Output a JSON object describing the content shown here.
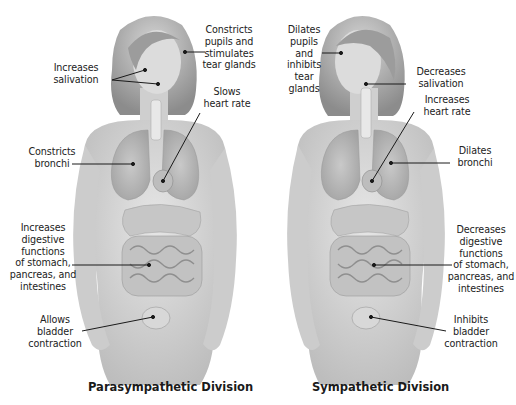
{
  "diagram": {
    "divisions": [
      {
        "name": "Parasympathetic Division",
        "labels": [
          {
            "id": "eyes",
            "text": "Constricts\npupils and\nstimulates\ntear glands"
          },
          {
            "id": "salivation",
            "text": "Increases\nsalivation"
          },
          {
            "id": "heart",
            "text": "Slows\nheart rate"
          },
          {
            "id": "bronchi",
            "text": "Constricts\nbronchi"
          },
          {
            "id": "digestion",
            "text": "Increases\ndigestive\nfunctions\nof stomach,\npancreas, and\nintestines"
          },
          {
            "id": "bladder",
            "text": "Allows\nbladder\ncontraction"
          }
        ]
      },
      {
        "name": "Sympathetic Division",
        "labels": [
          {
            "id": "eyes",
            "text": "Dilates\npupils\nand\ninhibits\ntear\nglands"
          },
          {
            "id": "salivation",
            "text": "Decreases\nsalivation"
          },
          {
            "id": "heart",
            "text": "Increases\nheart rate"
          },
          {
            "id": "bronchi",
            "text": "Dilates\nbronchi"
          },
          {
            "id": "digestion",
            "text": "Decreases\ndigestive\nfunctions\nof stomach,\npancreas, and\nintestines"
          },
          {
            "id": "bladder",
            "text": "Inhibits\nbladder\ncontraction"
          }
        ]
      }
    ],
    "colors": {
      "skin": "#d9d9d9",
      "skin_shadow": "#b8b8b8",
      "hair": "#a8a8a8",
      "organ": "#c4c4c4",
      "line": "#1a1a1a",
      "text": "#222222"
    }
  }
}
